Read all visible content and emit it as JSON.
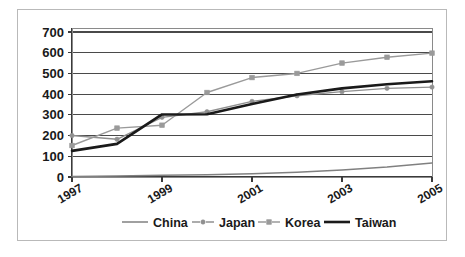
{
  "figure": {
    "border_color": "#b9b9b9",
    "background": "#ffffff"
  },
  "chart_data": {
    "type": "line",
    "title": "",
    "subtitle": "",
    "xlabel": "",
    "ylabel": "",
    "x": [
      1997,
      1998,
      1999,
      2000,
      2001,
      2002,
      2003,
      2004,
      2005
    ],
    "categories": [
      "1997",
      "1998",
      "1999",
      "2000",
      "2001",
      "2002",
      "2003",
      "2004",
      "2005"
    ],
    "xlim": [
      1997,
      2005
    ],
    "ylim": [
      0,
      700
    ],
    "ytick_labels": [
      "0",
      "100",
      "200",
      "300",
      "400",
      "500",
      "600",
      "700"
    ],
    "ytick_values": [
      0,
      100,
      200,
      300,
      400,
      500,
      600,
      700
    ],
    "xtick_labels": [
      "1997",
      "1999",
      "2001",
      "2003",
      "2005"
    ],
    "xtick_values": [
      1997,
      1999,
      2001,
      2003,
      2005
    ],
    "xtick_label_rotation": -30,
    "grid": true,
    "grid_axis": "y",
    "legend_position": "bottom",
    "series": [
      {
        "name": "China",
        "color": "#808080",
        "width": 1.5,
        "marker": "none",
        "values": [
          3,
          5,
          8,
          11,
          16,
          23,
          34,
          48,
          68
        ]
      },
      {
        "name": "Japan",
        "color": "#909090",
        "width": 1.4,
        "marker": "diamond",
        "values": [
          200,
          182,
          288,
          315,
          365,
          392,
          412,
          428,
          434
        ]
      },
      {
        "name": "Korea",
        "color": "#9a9a9a",
        "width": 1.4,
        "marker": "square",
        "values": [
          152,
          236,
          250,
          408,
          480,
          500,
          550,
          578,
          598
        ]
      },
      {
        "name": "Taiwan",
        "color": "#1a1a1a",
        "width": 2.6,
        "marker": "none",
        "values": [
          126,
          160,
          302,
          303,
          352,
          398,
          428,
          448,
          462
        ]
      }
    ]
  },
  "legend": {
    "entries": [
      {
        "label": "China",
        "swatch": "line-plain",
        "color": "#808080"
      },
      {
        "label": "Japan",
        "swatch": "line-diamond",
        "color": "#909090"
      },
      {
        "label": "Korea",
        "swatch": "line-square",
        "color": "#9a9a9a"
      },
      {
        "label": "Taiwan",
        "swatch": "line-thick",
        "color": "#1a1a1a"
      }
    ]
  }
}
